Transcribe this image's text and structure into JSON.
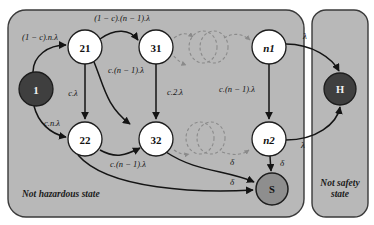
{
  "diagram": {
    "type": "state-transition-graph",
    "colors": {
      "region_fill": "#b8b8b8",
      "region_stroke": "#3a3a3a",
      "node_white_fill": "#ffffff",
      "node_dark_fill": "#3f3f3f",
      "node_gray_fill": "#8e8e8e",
      "node_stroke": "#1c1c1c",
      "edge_stroke": "#141414",
      "dashed_stroke": "#8a8a8a",
      "text_dark": "#111111",
      "text_light": "#f2f2f2"
    },
    "regions": [
      {
        "id": "not-hazardous",
        "label": "Not hazardous state",
        "lines": [
          "Not hazardous state"
        ]
      },
      {
        "id": "not-safety",
        "label": "Not safety state",
        "lines": [
          "Not safety",
          "state"
        ]
      }
    ],
    "nodes": [
      {
        "id": "n1state",
        "label": "1",
        "style": "dark",
        "cx": 36,
        "cy": 89,
        "r": 17
      },
      {
        "id": "s21",
        "label": "21",
        "style": "white",
        "cx": 85,
        "cy": 47,
        "r": 17
      },
      {
        "id": "s22",
        "label": "22",
        "style": "white",
        "cx": 85,
        "cy": 139,
        "r": 17
      },
      {
        "id": "s31",
        "label": "31",
        "style": "white",
        "cx": 156,
        "cy": 47,
        "r": 17
      },
      {
        "id": "s32",
        "label": "32",
        "style": "white",
        "cx": 156,
        "cy": 139,
        "r": 17
      },
      {
        "id": "sn1",
        "label": "n1",
        "style": "white",
        "cx": 269,
        "cy": 47,
        "r": 17,
        "italic": true
      },
      {
        "id": "sn2",
        "label": "n2",
        "style": "white",
        "cx": 269,
        "cy": 139,
        "r": 17,
        "italic": true
      },
      {
        "id": "sH",
        "label": "H",
        "style": "dark",
        "cx": 340,
        "cy": 89,
        "r": 16
      },
      {
        "id": "sS",
        "label": "S",
        "style": "gray",
        "cx": 272,
        "cy": 189,
        "r": 16
      }
    ],
    "edges": [
      {
        "id": "e1-21",
        "from": "1",
        "to": "21",
        "label": "(1 − c).n.λ",
        "lx": 36,
        "ly": 39
      },
      {
        "id": "e1-22",
        "from": "1",
        "to": "22",
        "label": "c.n.λ",
        "lx": 52,
        "ly": 126
      },
      {
        "id": "e21-31",
        "from": "21",
        "to": "31",
        "label": "(1 − c).(n − 1).λ",
        "lx": 122,
        "ly": 22
      },
      {
        "id": "e21-22",
        "from": "21",
        "to": "22",
        "label": "c.λ",
        "lx": 76,
        "ly": 95
      },
      {
        "id": "e21-32",
        "from": "21",
        "to": "32",
        "label": "c.(n − 1).λ",
        "lx": 125,
        "ly": 73
      },
      {
        "id": "e31-32",
        "from": "31",
        "to": "32",
        "label": "c.2.λ",
        "lx": 172,
        "ly": 94
      },
      {
        "id": "en1-n2",
        "from": "n1",
        "to": "n2",
        "label": "c.(n − 1).λ",
        "lx": 236,
        "ly": 92
      },
      {
        "id": "e22-32",
        "from": "22",
        "to": "32",
        "label": "c.(n − 1).λ",
        "lx": 127,
        "ly": 165
      },
      {
        "id": "en1-H",
        "from": "n1",
        "to": "H",
        "label": "λ",
        "lx": 304,
        "ly": 39
      },
      {
        "id": "en2-H",
        "from": "n2",
        "to": "H",
        "label": "λ",
        "lx": 304,
        "ly": 145
      },
      {
        "id": "en2-S",
        "from": "n2",
        "to": "S",
        "label": "δ",
        "lx": 282,
        "ly": 167
      },
      {
        "id": "e32-S",
        "from": "32",
        "to": "S",
        "label": "δ",
        "lx": 234,
        "ly": 165
      },
      {
        "id": "e22-S",
        "from": "22",
        "to": "S",
        "label": "δ",
        "lx": 234,
        "ly": 184
      }
    ],
    "ellipsis_groups": [
      {
        "id": "ellipsis-top",
        "note": "omitted intermediate states (top row)"
      },
      {
        "id": "ellipsis-bottom",
        "note": "omitted intermediate states (bottom row)"
      }
    ]
  }
}
